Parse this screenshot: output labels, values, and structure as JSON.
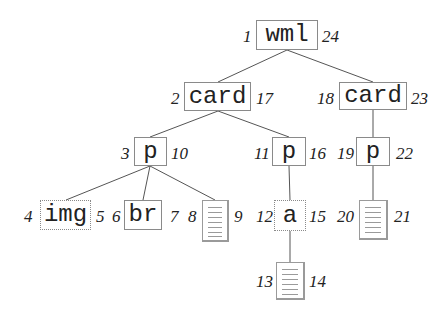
{
  "diagram": {
    "type": "tree",
    "nodes": [
      {
        "id": "wml",
        "label": "wml",
        "kind": "element",
        "pre": "1",
        "post": "24"
      },
      {
        "id": "card1",
        "label": "card",
        "kind": "element",
        "pre": "2",
        "post": "17"
      },
      {
        "id": "card2",
        "label": "card",
        "kind": "element",
        "pre": "18",
        "post": "23"
      },
      {
        "id": "p1",
        "label": "p",
        "kind": "element",
        "pre": "3",
        "post": "10"
      },
      {
        "id": "p2",
        "label": "p",
        "kind": "element",
        "pre": "11",
        "post": "16"
      },
      {
        "id": "p3",
        "label": "p",
        "kind": "element",
        "pre": "19",
        "post": "22"
      },
      {
        "id": "img",
        "label": "img",
        "kind": "element",
        "pre": "4",
        "post": "5"
      },
      {
        "id": "br",
        "label": "br",
        "kind": "element",
        "pre": "6",
        "post": "7"
      },
      {
        "id": "text1",
        "label": "",
        "kind": "text-document",
        "pre": "8",
        "post": "9"
      },
      {
        "id": "a",
        "label": "a",
        "kind": "element",
        "pre": "12",
        "post": "15"
      },
      {
        "id": "text2",
        "label": "",
        "kind": "text-document",
        "pre": "13",
        "post": "14"
      },
      {
        "id": "text3",
        "label": "",
        "kind": "text-document",
        "pre": "20",
        "post": "21"
      }
    ],
    "edges": [
      [
        "wml",
        "card1"
      ],
      [
        "wml",
        "card2"
      ],
      [
        "card1",
        "p1"
      ],
      [
        "card1",
        "p2"
      ],
      [
        "card2",
        "p3"
      ],
      [
        "p1",
        "img"
      ],
      [
        "p1",
        "br"
      ],
      [
        "p1",
        "text1"
      ],
      [
        "p2",
        "a"
      ],
      [
        "a",
        "text2"
      ],
      [
        "p3",
        "text3"
      ]
    ]
  },
  "labels": {
    "wml": {
      "text": "wml",
      "pre": "1",
      "post": "24"
    },
    "card1": {
      "text": "card",
      "pre": "2",
      "post": "17"
    },
    "card2": {
      "text": "card",
      "pre": "18",
      "post": "23"
    },
    "p1": {
      "text": "p",
      "pre": "3",
      "post": "10"
    },
    "p2": {
      "text": "p",
      "pre": "11",
      "post": "16"
    },
    "p3": {
      "text": "p",
      "pre": "19",
      "post": "22"
    },
    "img": {
      "text": "img",
      "pre": "4",
      "post": "5"
    },
    "br": {
      "text": "br",
      "pre": "6",
      "post": "7"
    },
    "text1": {
      "pre": "8",
      "post": "9"
    },
    "a": {
      "text": "a",
      "pre": "12",
      "post": "15"
    },
    "text2": {
      "pre": "13",
      "post": "14"
    },
    "text3": {
      "pre": "20",
      "post": "21"
    }
  }
}
